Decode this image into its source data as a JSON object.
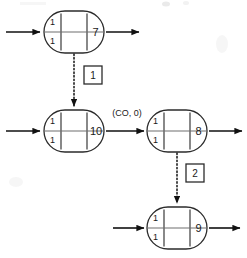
{
  "diagram": {
    "colors": {
      "stroke": "#2b2b2b",
      "text": "#1a1a1a",
      "background": "#ffffff",
      "divider": "#6e6e6e"
    },
    "nodes": [
      {
        "id": "node-7",
        "label": "7",
        "cell_top": "1",
        "cell_bottom": "1",
        "cx": 74,
        "cy": 32,
        "rx": 30,
        "ry": 21
      },
      {
        "id": "node-10",
        "label": "10",
        "cell_top": "1",
        "cell_bottom": "1",
        "cx": 74,
        "cy": 131,
        "rx": 30,
        "ry": 21
      },
      {
        "id": "node-8",
        "label": "8",
        "cell_top": "1",
        "cell_bottom": "1",
        "cx": 177,
        "cy": 131,
        "rx": 30,
        "ry": 21
      },
      {
        "id": "node-9",
        "label": "9",
        "cell_top": "1",
        "cell_bottom": "1",
        "cx": 177,
        "cy": 228,
        "rx": 30,
        "ry": 21
      }
    ],
    "edge_labels": [
      {
        "id": "edge-co-0",
        "text": "(CO, 0)",
        "x": 127,
        "y": 114
      }
    ],
    "transition_boxes": [
      {
        "id": "transition-1",
        "label": "1",
        "x": 84,
        "y": 66,
        "w": 18,
        "h": 18
      },
      {
        "id": "transition-2",
        "label": "2",
        "x": 186,
        "y": 164,
        "w": 18,
        "h": 18
      }
    ],
    "flow_arrows": [
      {
        "id": "arrow-in-node-7",
        "from": [
          6,
          32
        ],
        "to": [
          42,
          32
        ],
        "style": "solid"
      },
      {
        "id": "arrow-out-node-7",
        "from": [
          106,
          32
        ],
        "to": [
          140,
          32
        ],
        "style": "solid"
      },
      {
        "id": "arrow-in-node-10",
        "from": [
          6,
          131
        ],
        "to": [
          42,
          131
        ],
        "style": "solid"
      },
      {
        "id": "arrow-node-10-to-node-8",
        "from": [
          106,
          131
        ],
        "to": [
          145,
          131
        ],
        "style": "solid"
      },
      {
        "id": "arrow-out-node-8",
        "from": [
          209,
          131
        ],
        "to": [
          243,
          131
        ],
        "style": "solid"
      },
      {
        "id": "arrow-in-node-9",
        "from": [
          113,
          228
        ],
        "to": [
          145,
          228
        ],
        "style": "solid"
      },
      {
        "id": "arrow-out-node-9",
        "from": [
          209,
          228
        ],
        "to": [
          241,
          228
        ],
        "style": "solid"
      }
    ],
    "dotted_arrows": [
      {
        "id": "dotted-node-7-to-node-10",
        "from": [
          74,
          54
        ],
        "to": [
          74,
          108
        ],
        "style": "dotted"
      },
      {
        "id": "dotted-node-8-to-node-9",
        "from": [
          177,
          153
        ],
        "to": [
          177,
          205
        ],
        "style": "dotted"
      }
    ]
  }
}
